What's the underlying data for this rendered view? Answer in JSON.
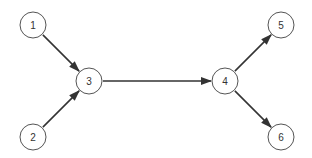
{
  "diagram": {
    "type": "directed-graph",
    "nodes": [
      {
        "id": "1",
        "label": "1",
        "x": 33,
        "y": 25
      },
      {
        "id": "2",
        "label": "2",
        "x": 33,
        "y": 137
      },
      {
        "id": "3",
        "label": "3",
        "x": 89,
        "y": 81
      },
      {
        "id": "4",
        "label": "4",
        "x": 225,
        "y": 81
      },
      {
        "id": "5",
        "label": "5",
        "x": 281,
        "y": 25
      },
      {
        "id": "6",
        "label": "6",
        "x": 281,
        "y": 137
      }
    ],
    "edges": [
      {
        "from": "1",
        "to": "3"
      },
      {
        "from": "2",
        "to": "3"
      },
      {
        "from": "3",
        "to": "4"
      },
      {
        "from": "4",
        "to": "5"
      },
      {
        "from": "4",
        "to": "6"
      }
    ],
    "node_radius": 13,
    "colors": {
      "stroke": "#555555",
      "edge": "#333333",
      "text": "#333333"
    }
  }
}
